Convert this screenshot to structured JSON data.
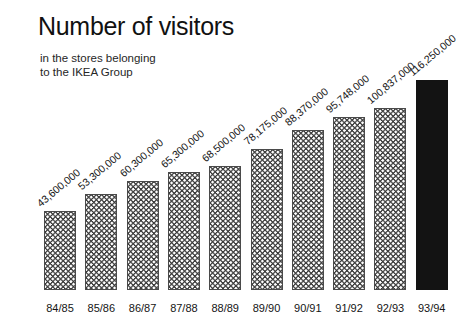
{
  "header": {
    "title": "Number of visitors",
    "subtitle_line1": "in the stores belonging",
    "subtitle_line2": "to the IKEA Group"
  },
  "colors": {
    "background": "#ffffff",
    "text": "#141414",
    "bar_outline": "#4a4a4a",
    "bar_hatch": "#3a3a3a",
    "bar_highlight": "#131313"
  },
  "chart_data": {
    "type": "bar",
    "title": "Number of visitors",
    "subtitle": "in the stores belonging to the IKEA Group",
    "xlabel": "",
    "ylabel": "",
    "grid": false,
    "legend": false,
    "ylim": [
      0,
      116250000
    ],
    "categories": [
      "84/85",
      "85/86",
      "86/87",
      "87/88",
      "88/89",
      "89/90",
      "90/91",
      "91/92",
      "92/93",
      "93/94"
    ],
    "values": [
      43600000,
      53300000,
      60300000,
      65300000,
      68500000,
      78175000,
      88370000,
      95748000,
      100837000,
      116250000
    ],
    "value_labels": [
      "43,600,000",
      "53,300,000",
      "60,300,000",
      "65,300,000",
      "68,500,000",
      "78,175,000",
      "88,370,000",
      "95,748,000",
      "100,837,000",
      "116,250,000"
    ],
    "highlight_index": 9,
    "label_rotation_deg": -40
  }
}
